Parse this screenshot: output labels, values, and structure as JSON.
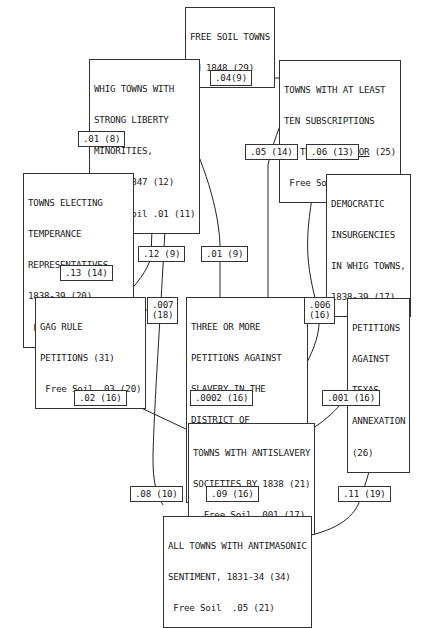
{
  "nodes": {
    "free_soil": {
      "lines": [
        "FREE SOIL TOWNS",
        "IN 1848 (29)"
      ]
    },
    "whig": {
      "lines": [
        "WHIG TOWNS WITH",
        "STRONG LIBERTY",
        "MINORITIES,",
        "1844, 1847 (12)",
        " Free Soil .01 (11)"
      ]
    },
    "liberator": {
      "lines": [
        "TOWNS WITH AT LEAST",
        "TEN SUBSCRIPTIONS"
      ],
      "line3_prefix": "TO THE ",
      "line3_underlined": "LIBERATOR",
      "line3_suffix": " (25)",
      "line4": " Free Soil .03 (18)"
    },
    "temperance": {
      "lines": [
        "TOWNS ELECTING",
        "TEMPERANCE",
        "REPRESENTATIVES,",
        "1838-39 (20)",
        " Free Soil .04 (12)"
      ]
    },
    "democratic": {
      "lines": [
        "DEMOCRATIC",
        "INSURGENCIES",
        "IN WHIG TOWNS,",
        "1838-39 (17)"
      ]
    },
    "gag_rule": {
      "lines": [
        "GAG RULE",
        "PETITIONS (31)",
        " Free Soil .03 (20)"
      ]
    },
    "dc_petitions": {
      "lines": [
        "THREE OR MORE",
        "PETITIONS AGAINST",
        "SLAVERY IN THE",
        "DISTRICT OF",
        "COLUMBIA (23)",
        " Free Soil .0005 (19)"
      ]
    },
    "texas": {
      "lines": [
        "PETITIONS",
        "AGAINST",
        "TEXAS",
        "ANNEXATION",
        "(26)"
      ]
    },
    "antislavery": {
      "lines": [
        "TOWNS WITH ANTISLAVERY",
        "SOCIETIES BY 1838 (21)",
        "  Free Soil .001 (17)"
      ]
    },
    "antimasonic": {
      "lines": [
        "ALL TOWNS WITH ANTIMASONIC",
        "SENTIMENT, 1831-34 (34)",
        " Free Soil  .05 (21)"
      ]
    }
  },
  "edges": [
    {
      "id": "whig-liberator",
      "from": "whig",
      "to": "liberator",
      "label": ".04(9)",
      "directed": false
    },
    {
      "id": "temperance-whig",
      "from": "temperance",
      "to": "whig",
      "label": ".01 (8)",
      "directed": true
    },
    {
      "id": "gag-temperance",
      "from": "gag_rule",
      "to": "temperance",
      "label": ".13 (14)",
      "directed": true
    },
    {
      "id": "gag-whig",
      "from": "gag_rule",
      "to": "whig",
      "label": ".12 (9)",
      "directed": true
    },
    {
      "id": "dc-whig",
      "from": "dc_petitions",
      "to": "whig",
      "label": ".01 (9)",
      "directed": true
    },
    {
      "id": "dc-liberator",
      "from": "dc_petitions",
      "to": "liberator",
      "label": ".05 (14)",
      "directed": true
    },
    {
      "id": "antislavery-liberator",
      "from": "antislavery",
      "to": "liberator",
      "label": ".06 (13)",
      "directed": true
    },
    {
      "id": "gag-dc",
      "from": "gag_rule",
      "to": "dc_petitions",
      "label": ".007\n(18)",
      "directed": false
    },
    {
      "id": "dc-texas",
      "from": "dc_petitions",
      "to": "texas",
      "label": ".006\n(16)",
      "directed": false
    },
    {
      "id": "antislavery-gag",
      "from": "antislavery",
      "to": "gag_rule",
      "label": ".02 (16)",
      "directed": true
    },
    {
      "id": "antislavery-dc",
      "from": "antislavery",
      "to": "dc_petitions",
      "label": ".0002 (16)",
      "directed": true
    },
    {
      "id": "antislavery-texas",
      "from": "antislavery",
      "to": "texas",
      "label": ".001 (16)",
      "directed": true
    },
    {
      "id": "antimasonic-whig",
      "from": "antimasonic",
      "to": "whig",
      "label": ".08 (10)",
      "directed": true
    },
    {
      "id": "antimasonic-antislavery",
      "from": "antimasonic",
      "to": "antislavery",
      "label": ".09 (16)",
      "directed": true
    },
    {
      "id": "antimasonic-texas",
      "from": "antimasonic",
      "to": "texas",
      "label": ".11 (19)",
      "directed": true
    }
  ]
}
